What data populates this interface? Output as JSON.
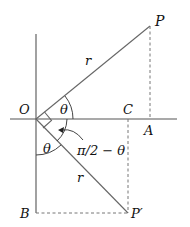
{
  "diagram": {
    "type": "geometry-rotation",
    "points": {
      "O": {
        "label": "O",
        "x": 36,
        "y": 119
      },
      "P": {
        "label": "P",
        "x": 150,
        "y": 26
      },
      "A": {
        "label": "A",
        "x": 150,
        "y": 119
      },
      "C": {
        "label": "C",
        "x": 128,
        "y": 119
      },
      "P_prime": {
        "label": "P′",
        "x": 128,
        "y": 213
      },
      "B": {
        "label": "B",
        "x": 36,
        "y": 213
      }
    },
    "labels": {
      "r_upper": "r",
      "r_lower": "r",
      "theta_upper": "θ",
      "theta_lower": "θ",
      "complement": "π/2 − θ"
    }
  }
}
